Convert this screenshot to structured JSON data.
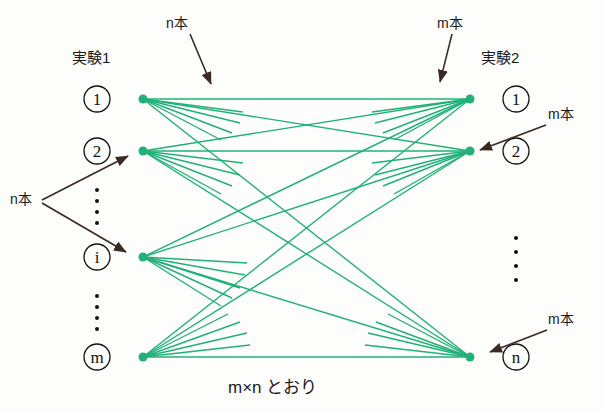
{
  "diagram": {
    "title_left": "実験1",
    "title_right": "実験2",
    "caption": "m×n とおり",
    "edge_color": "#21b07a",
    "node_color": "#111111",
    "arrow_color": "#3a2a22",
    "annotations": [
      {
        "id": "ann-top-left",
        "text": "n本"
      },
      {
        "id": "ann-top-right",
        "text": "m本"
      },
      {
        "id": "ann-right-upper",
        "text": "m本"
      },
      {
        "id": "ann-left-mid",
        "text": "n本"
      },
      {
        "id": "ann-right-lower",
        "text": "m本"
      }
    ],
    "left_nodes": [
      {
        "label": "1"
      },
      {
        "label": "2"
      },
      {
        "label": "i"
      },
      {
        "label": "m"
      }
    ],
    "right_nodes": [
      {
        "label": "1"
      },
      {
        "label": "2"
      },
      {
        "label": "n"
      }
    ],
    "left_vertical_dots": "・\n・\n・\n・",
    "right_vertical_dots": "・\n・\n・\n・"
  }
}
